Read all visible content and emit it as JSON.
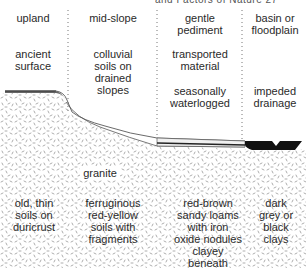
{
  "header_fragment": "and Factors of Nature   27",
  "zones": [
    {
      "id": "upland",
      "title": [
        "upland"
      ],
      "landform": [
        "ancient",
        "surface"
      ],
      "soil": [
        "old, thin",
        "soils on",
        "duricrust"
      ]
    },
    {
      "id": "mid-slope",
      "title": [
        "mid-slope"
      ],
      "landform": [
        "colluvial",
        "soils on",
        "drained",
        "slopes"
      ],
      "soil": [
        "ferruginous",
        "red-yellow",
        "soils with",
        "fragments"
      ]
    },
    {
      "id": "gentle-pediment",
      "title": [
        "gentle",
        "pediment"
      ],
      "landform": [
        "transported",
        "material"
      ],
      "drainage": [
        "seasonally",
        "waterlogged"
      ],
      "soil": [
        "red-brown",
        "sandy loams",
        "with iron",
        "oxide nodules",
        "clayey",
        "beneath"
      ]
    },
    {
      "id": "basin",
      "title": [
        "basin or",
        "floodplain"
      ],
      "drainage": [
        "impeded",
        "drainage"
      ],
      "soil": [
        "dark",
        "grey or",
        "black",
        "clays"
      ]
    }
  ],
  "bedrock_label": "granite",
  "colors": {
    "bedrock_dot": "#8a8a8a",
    "surface_line": "#444444",
    "clay": "#111111",
    "divider": "#777777"
  }
}
